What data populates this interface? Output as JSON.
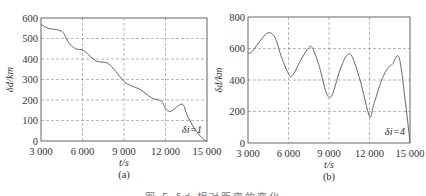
{
  "figure": {
    "caption": "图 5   δd 相对距离的变化"
  },
  "chart_data": [
    {
      "type": "line",
      "panel_label": "(a)",
      "annotation": "δi=1",
      "xlabel": "t/s",
      "ylabel": "δd/km",
      "xlim": [
        3000,
        15000
      ],
      "ylim": [
        0,
        600
      ],
      "xticks": [
        3000,
        6000,
        9000,
        12000,
        15000
      ],
      "xtick_labels": [
        "3 000",
        "6 000",
        "9 000",
        "12 000",
        "15 000"
      ],
      "yticks": [
        0,
        100,
        200,
        300,
        400,
        500,
        600
      ],
      "ytick_labels": [
        "0",
        "100",
        "200",
        "300",
        "400",
        "500",
        "600"
      ],
      "grid": true,
      "x": [
        3000,
        3500,
        4500,
        5000,
        5500,
        6000,
        6200,
        7000,
        7800,
        8400,
        9000,
        9500,
        10200,
        11000,
        11700,
        12000,
        12400,
        13200,
        13600,
        14200,
        14800,
        15000
      ],
      "y": [
        570,
        550,
        535,
        480,
        450,
        445,
        435,
        390,
        380,
        340,
        290,
        270,
        250,
        210,
        195,
        160,
        145,
        180,
        120,
        50,
        5,
        0
      ]
    },
    {
      "type": "line",
      "panel_label": "(b)",
      "annotation": "δi=4",
      "xlabel": "t/s",
      "ylabel": "δd/km",
      "xlim": [
        3000,
        15000
      ],
      "ylim": [
        0,
        800
      ],
      "xticks": [
        3000,
        6000,
        9000,
        12000,
        15000
      ],
      "xtick_labels": [
        "3 000",
        "6 000",
        "9 000",
        "12 000",
        "15 000"
      ],
      "yticks": [
        0,
        200,
        400,
        600,
        800
      ],
      "ytick_labels": [
        "0",
        "200",
        "400",
        "600",
        "800"
      ],
      "grid": true,
      "x": [
        3000,
        3300,
        4000,
        4500,
        5000,
        5500,
        6000,
        6300,
        7000,
        7500,
        7800,
        8300,
        8800,
        9200,
        9800,
        10300,
        10700,
        11300,
        12000,
        12300,
        12900,
        13400,
        13700,
        14200,
        14700,
        15000
      ],
      "y": [
        570,
        580,
        660,
        700,
        670,
        540,
        440,
        430,
        540,
        605,
        600,
        480,
        320,
        300,
        460,
        555,
        550,
        400,
        170,
        240,
        400,
        480,
        500,
        540,
        230,
        0
      ]
    }
  ]
}
